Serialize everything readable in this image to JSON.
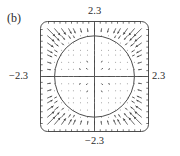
{
  "figure": {
    "panel_label": "(b)",
    "kind": "direction-field-phase-portrait"
  },
  "axes": {
    "top_label": "2.3",
    "bottom_label": "−2.3",
    "left_label": "−2.3",
    "right_label": "2.3"
  },
  "colors": {
    "ink": "#2b2b2b",
    "frame": "#3a3a3a",
    "axis": "#555555",
    "arrow": "#444444",
    "circle": "#3a3a3a",
    "background": "#ffffff"
  },
  "chart_data": {
    "type": "scatter",
    "title": "",
    "xlabel": "",
    "ylabel": "",
    "xlim": [
      -2.3,
      2.3
    ],
    "ylim": [
      -2.3,
      2.3
    ],
    "grid": false,
    "xtick_labels": [
      "−2.3",
      "2.3"
    ],
    "ytick_labels": [
      "−2.3",
      "2.3"
    ],
    "annotations": [
      "(b)"
    ],
    "features": {
      "limit_cycle_radius": 1.7,
      "field_description": "vectors outside the circle point inward toward the limit cycle; vectors inside the circle are very short (near-zero magnitude)",
      "grid_samples_per_axis": 17,
      "frame": "rounded rectangle with small tick marks along all four sides"
    },
    "series": [
      {
        "name": "limit cycle",
        "kind": "circle",
        "center": [
          0,
          0
        ],
        "radius": 1.7
      },
      {
        "name": "direction field",
        "kind": "quiver",
        "x": [
          -2.3,
          -2.0,
          -1.7,
          -1.4,
          -1.1,
          -0.9,
          -0.6,
          -0.3,
          0.0,
          0.3,
          0.6,
          0.9,
          1.1,
          1.4,
          1.7,
          2.0,
          2.3
        ],
        "y": [
          -2.3,
          -2.0,
          -1.7,
          -1.4,
          -1.1,
          -0.9,
          -0.6,
          -0.3,
          0.0,
          0.3,
          0.6,
          0.9,
          1.1,
          1.4,
          1.7,
          2.0,
          2.3
        ]
      }
    ]
  }
}
